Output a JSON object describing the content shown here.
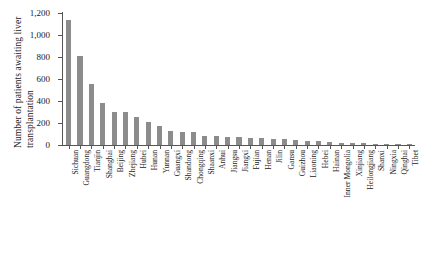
{
  "chart_data": {
    "type": "bar",
    "title": "",
    "subtitle": "",
    "xlabel": "",
    "ylabel": "Number of patients awaiting liver transplantation",
    "ylabel_lines": [
      "Number of patients awaiting liver",
      "transplantation"
    ],
    "ylim": [
      0,
      1200
    ],
    "yticks": [
      0,
      200,
      400,
      600,
      800,
      1000,
      1200
    ],
    "ytick_labels": [
      "0",
      "200",
      "400",
      "600",
      "800",
      "1,000",
      "1,200"
    ],
    "grid": false,
    "legend": null,
    "bar_color": "#8c8c8c",
    "axis_color": "#555555",
    "categories": [
      "Sichuan",
      "Guangdong",
      "Tianjin",
      "Shanghai",
      "Beijing",
      "Zhejiang",
      "Hubei",
      "Hunan",
      "Yunnan",
      "Guangxi",
      "Shandong",
      "Chongqing",
      "Shaanxi",
      "Anhui",
      "Jiangsu",
      "Jiangxi",
      "Fujian",
      "Henan",
      "Jilin",
      "Gansu",
      "Guizhou",
      "Liaoning",
      "Hebei",
      "Hainan",
      "Inner Mongolia",
      "Xinjiang",
      "Heilongjiang",
      "Shanxi",
      "Ningxia",
      "Qinghai",
      "Tibet"
    ],
    "values": [
      1140,
      805,
      558,
      378,
      302,
      296,
      254,
      212,
      175,
      128,
      120,
      118,
      86,
      80,
      76,
      72,
      68,
      62,
      58,
      52,
      46,
      40,
      34,
      28,
      22,
      18,
      14,
      10,
      6,
      4,
      2
    ]
  }
}
